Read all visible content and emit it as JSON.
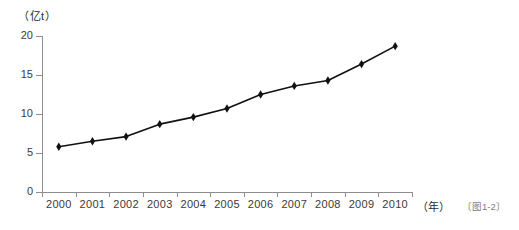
{
  "figure": {
    "caption": "〔图1-2〕",
    "y_unit_label": "（亿t）",
    "x_unit_label": "（年）"
  },
  "chart_data": {
    "type": "line",
    "title": "",
    "subtitle": "",
    "xlabel": "（年）",
    "ylabel": "（亿t）",
    "categories": [
      "2000",
      "2001",
      "2002",
      "2003",
      "2004",
      "2005",
      "2006",
      "2007",
      "2008",
      "2009",
      "2010"
    ],
    "values": [
      5.8,
      6.5,
      7.1,
      8.7,
      9.6,
      10.7,
      12.5,
      13.6,
      14.3,
      16.4,
      18.7
    ],
    "series": [
      {
        "name": "",
        "values": [
          5.8,
          6.5,
          7.1,
          8.7,
          9.6,
          10.7,
          12.5,
          13.6,
          14.3,
          16.4,
          18.7
        ]
      }
    ],
    "ylim": [
      0,
      20
    ],
    "ytick_labels": [
      "0",
      "5",
      "10",
      "15",
      "20"
    ],
    "ytick_values": [
      0,
      5,
      10,
      15,
      20
    ],
    "xtick_labels": [
      "2000",
      "2001",
      "2002",
      "2003",
      "2004",
      "2005",
      "2006",
      "2007",
      "2008",
      "2009",
      "2010"
    ],
    "grid": false,
    "legend": false,
    "legend_position": "none",
    "marker": "diamond",
    "line_color": "#111111",
    "marker_color": "#111111",
    "axis_color": "#8d8d8d",
    "background_color": "#ffffff"
  },
  "axis": {
    "y_ticks": [
      {
        "label": "20",
        "value": 20
      },
      {
        "label": "15",
        "value": 15
      },
      {
        "label": "10",
        "value": 10
      },
      {
        "label": "5",
        "value": 5
      },
      {
        "label": "0",
        "value": 0
      }
    ],
    "x_ticks": [
      {
        "label": "2000"
      },
      {
        "label": "2001"
      },
      {
        "label": "2002"
      },
      {
        "label": "2003"
      },
      {
        "label": "2004"
      },
      {
        "label": "2005"
      },
      {
        "label": "2006"
      },
      {
        "label": "2007"
      },
      {
        "label": "2008"
      },
      {
        "label": "2009"
      },
      {
        "label": "2010"
      }
    ]
  }
}
